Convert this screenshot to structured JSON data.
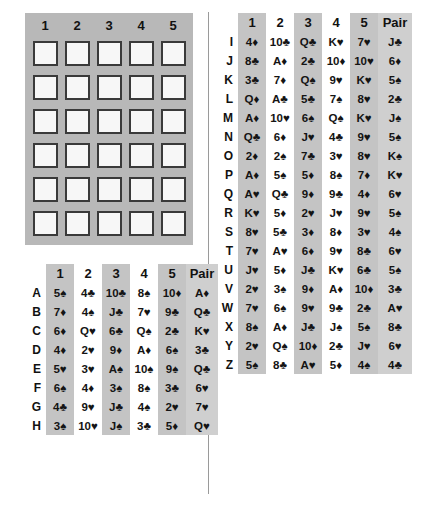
{
  "blank_grid": {
    "name": "blank-answer-grid",
    "columns": [
      "1",
      "2",
      "3",
      "4",
      "5"
    ],
    "rows": 6,
    "cols": 5
  },
  "tables": {
    "left": {
      "columns": [
        "1",
        "2",
        "3",
        "4",
        "5"
      ],
      "pair_header": "Pair",
      "rows": [
        {
          "label": "A",
          "cards": [
            "5♠",
            "4♣",
            "10♣",
            "8♠",
            "10♦"
          ],
          "pair": "A♦"
        },
        {
          "label": "B",
          "cards": [
            "7♦",
            "4♠",
            "J♣",
            "7♥",
            "9♣"
          ],
          "pair": "Q♣"
        },
        {
          "label": "C",
          "cards": [
            "6♦",
            "Q♥",
            "6♣",
            "Q♠",
            "2♣"
          ],
          "pair": "K♥"
        },
        {
          "label": "D",
          "cards": [
            "4♦",
            "2♥",
            "9♦",
            "A♦",
            "6♠"
          ],
          "pair": "3♣"
        },
        {
          "label": "E",
          "cards": [
            "5♥",
            "3♥",
            "A♠",
            "10♠",
            "9♠"
          ],
          "pair": "Q♣"
        },
        {
          "label": "F",
          "cards": [
            "6♠",
            "4♦",
            "3♠",
            "8♠",
            "3♣"
          ],
          "pair": "6♥"
        },
        {
          "label": "G",
          "cards": [
            "4♣",
            "9♥",
            "J♣",
            "4♠",
            "2♥"
          ],
          "pair": "7♥"
        },
        {
          "label": "H",
          "cards": [
            "3♠",
            "10♥",
            "J♠",
            "3♣",
            "5♦"
          ],
          "pair": "Q♥"
        }
      ]
    },
    "right": {
      "columns": [
        "1",
        "2",
        "3",
        "4",
        "5"
      ],
      "pair_header": "Pair",
      "rows": [
        {
          "label": "I",
          "cards": [
            "4♦",
            "10♣",
            "Q♣",
            "K♥",
            "7♥"
          ],
          "pair": "J♣"
        },
        {
          "label": "J",
          "cards": [
            "8♣",
            "A♦",
            "2♣",
            "10♦",
            "10♥"
          ],
          "pair": "6♦"
        },
        {
          "label": "K",
          "cards": [
            "3♣",
            "7♦",
            "Q♠",
            "9♥",
            "K♥"
          ],
          "pair": "5♠"
        },
        {
          "label": "L",
          "cards": [
            "Q♦",
            "A♣",
            "5♣",
            "7♠",
            "8♥"
          ],
          "pair": "2♣"
        },
        {
          "label": "M",
          "cards": [
            "A♦",
            "10♥",
            "6♠",
            "Q♠",
            "K♥"
          ],
          "pair": "J♠"
        },
        {
          "label": "N",
          "cards": [
            "Q♣",
            "6♦",
            "J♥",
            "4♣",
            "9♥"
          ],
          "pair": "5♠"
        },
        {
          "label": "O",
          "cards": [
            "2♦",
            "2♠",
            "7♣",
            "3♥",
            "8♥"
          ],
          "pair": "K♠"
        },
        {
          "label": "P",
          "cards": [
            "A♦",
            "5♠",
            "5♦",
            "8♠",
            "7♦"
          ],
          "pair": "K♥"
        },
        {
          "label": "Q",
          "cards": [
            "A♥",
            "Q♣",
            "9♦",
            "9♣",
            "4♦"
          ],
          "pair": "6♥"
        },
        {
          "label": "R",
          "cards": [
            "K♥",
            "5♦",
            "2♥",
            "J♥",
            "9♥"
          ],
          "pair": "5♠"
        },
        {
          "label": "S",
          "cards": [
            "8♥",
            "5♣",
            "3♦",
            "8♦",
            "3♥"
          ],
          "pair": "4♠"
        },
        {
          "label": "T",
          "cards": [
            "7♥",
            "A♥",
            "6♦",
            "9♥",
            "8♣"
          ],
          "pair": "6♥"
        },
        {
          "label": "U",
          "cards": [
            "J♥",
            "5♦",
            "J♣",
            "K♥",
            "6♣"
          ],
          "pair": "5♠"
        },
        {
          "label": "V",
          "cards": [
            "2♥",
            "3♠",
            "9♦",
            "A♦",
            "10♦"
          ],
          "pair": "3♣"
        },
        {
          "label": "W",
          "cards": [
            "7♥",
            "6♠",
            "9♥",
            "9♣",
            "2♣"
          ],
          "pair": "A♥"
        },
        {
          "label": "X",
          "cards": [
            "8♠",
            "A♦",
            "J♣",
            "J♠",
            "5♠"
          ],
          "pair": "8♣"
        },
        {
          "label": "Y",
          "cards": [
            "2♥",
            "Q♠",
            "10♦",
            "2♣",
            "J♥"
          ],
          "pair": "6♥"
        },
        {
          "label": "Z",
          "cards": [
            "5♠",
            "8♣",
            "A♥",
            "5♦",
            "4♠"
          ],
          "pair": "4♣"
        }
      ]
    }
  },
  "colors": {
    "panel_gray": "#b8b8b8",
    "band_gray": "#c4c4c4",
    "pair_gray": "#cfcfcf",
    "cell_fill": "#f7f7f7",
    "cell_border": "#3a3a3a",
    "text": "#141414"
  }
}
